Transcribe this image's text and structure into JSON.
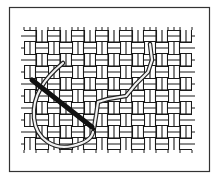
{
  "figure": {
    "alt_text": "Illustration of a threaded needle working a stitch diagonally across woven canvas",
    "colors": {
      "background": "#ffffff",
      "frame": "#333333",
      "weave_line": "#1a1a1a",
      "needle": "#111111",
      "thread_outline": "#222222",
      "thread_fill": "#f2f2f2"
    },
    "frame": {
      "x": 9,
      "y": 7,
      "width": 201,
      "height": 165
    },
    "weave": {
      "x": 24,
      "y": 30,
      "width": 168,
      "height": 120,
      "cell": 12
    },
    "needle": {
      "x1": 32,
      "y1": 80,
      "x2": 92,
      "y2": 127
    }
  }
}
